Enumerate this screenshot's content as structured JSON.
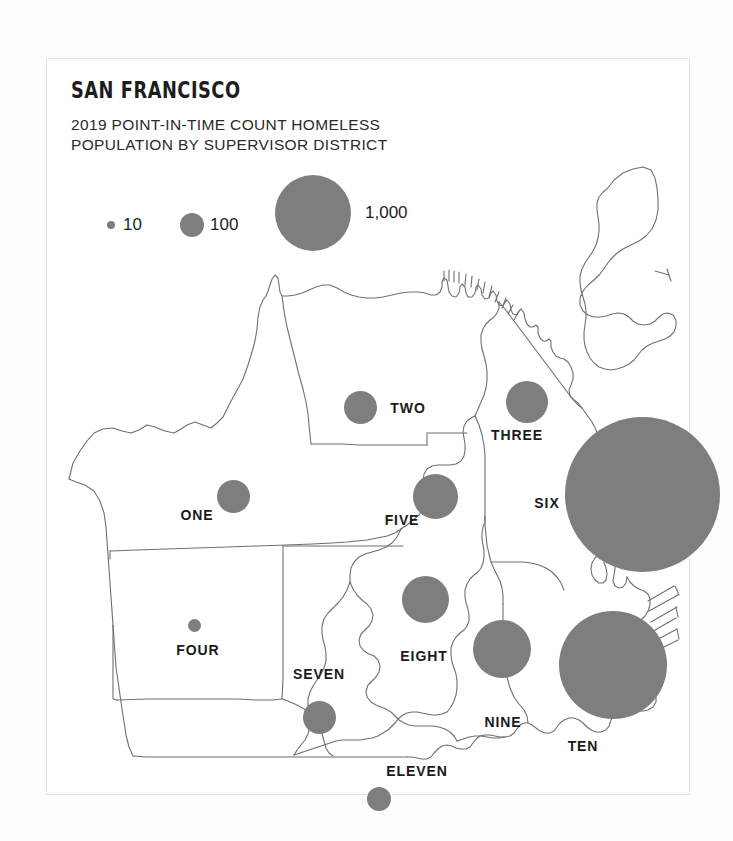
{
  "header": {
    "title": "SAN FRANCISCO",
    "subtitle": "2019 POINT-IN-TIME COUNT HOMELESS\nPOPULATION BY SUPERVISOR DISTRICT"
  },
  "legend": {
    "title": "",
    "items": [
      {
        "label": "10",
        "value": 10,
        "diameter_px": 8
      },
      {
        "label": "100",
        "value": 100,
        "diameter_px": 24
      },
      {
        "label": "1,000",
        "value": 1000,
        "diameter_px": 76
      }
    ]
  },
  "colors": {
    "bubble_fill": "#7e7e7e",
    "map_stroke": "#6f6f6f",
    "card_bg": "#ffffff",
    "page_bg": "#fdfdfd",
    "text": "#1d1d1d"
  },
  "chart_data": {
    "type": "bubble-map",
    "title": "SAN FRANCISCO",
    "subtitle": "2019 POINT-IN-TIME COUNT HOMELESS POPULATION BY SUPERVISOR DISTRICT",
    "xlabel": "",
    "ylabel": "",
    "legend_position": "top-left",
    "grid": false,
    "size_legend": [
      10,
      100,
      1000
    ],
    "categories": [
      "ONE",
      "TWO",
      "THREE",
      "FOUR",
      "FIVE",
      "SIX",
      "SEVEN",
      "EIGHT",
      "NINE",
      "TEN",
      "ELEVEN"
    ],
    "values": [
      190,
      185,
      305,
      25,
      355,
      4230,
      185,
      390,
      600,
      2160,
      95
    ],
    "points": [
      {
        "name": "ONE",
        "value": 190,
        "diameter_px": 33,
        "cx": 186,
        "cy": 437,
        "label_x": 150,
        "label_y": 456
      },
      {
        "name": "TWO",
        "value": 185,
        "diameter_px": 33,
        "cx": 313,
        "cy": 348,
        "label_x": 361,
        "label_y": 349
      },
      {
        "name": "THREE",
        "value": 305,
        "diameter_px": 42,
        "cx": 480,
        "cy": 343,
        "label_x": 470,
        "label_y": 376
      },
      {
        "name": "FOUR",
        "value": 25,
        "diameter_px": 13,
        "cx": 147,
        "cy": 566,
        "label_x": 151,
        "label_y": 591
      },
      {
        "name": "FIVE",
        "value": 355,
        "diameter_px": 45,
        "cx": 388,
        "cy": 437,
        "label_x": 355,
        "label_y": 461
      },
      {
        "name": "SIX",
        "value": 4230,
        "diameter_px": 155,
        "cx": 595,
        "cy": 435,
        "label_x": 500,
        "label_y": 444
      },
      {
        "name": "SEVEN",
        "value": 185,
        "diameter_px": 33,
        "cx": 272,
        "cy": 658,
        "label_x": 272,
        "label_y": 615
      },
      {
        "name": "EIGHT",
        "value": 390,
        "diameter_px": 47,
        "cx": 378,
        "cy": 540,
        "label_x": 377,
        "label_y": 597
      },
      {
        "name": "NINE",
        "value": 600,
        "diameter_px": 58,
        "cx": 455,
        "cy": 590,
        "label_x": 456,
        "label_y": 663
      },
      {
        "name": "TEN",
        "value": 2160,
        "diameter_px": 108,
        "cx": 566,
        "cy": 606,
        "label_x": 536,
        "label_y": 687
      },
      {
        "name": "ELEVEN",
        "value": 95,
        "diameter_px": 24,
        "cx": 332,
        "cy": 740,
        "label_x": 370,
        "label_y": 712
      }
    ]
  }
}
